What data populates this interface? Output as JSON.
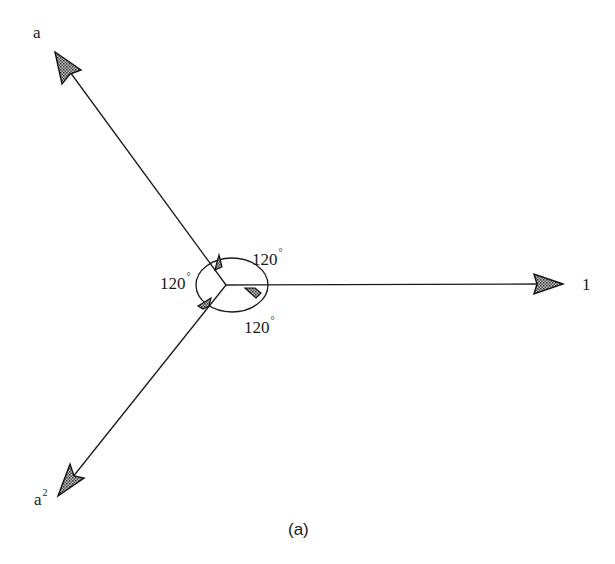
{
  "figure": {
    "caption": "(a)",
    "vectors": [
      {
        "name": "1",
        "label": "1",
        "angle_deg": 0
      },
      {
        "name": "a",
        "label": "a",
        "angle_deg": 120
      },
      {
        "name": "a2",
        "label": "a",
        "label_superscript": "2",
        "angle_deg": 240
      }
    ],
    "angle_labels": [
      {
        "value": "120",
        "unit": "°",
        "position": "upper-right"
      },
      {
        "value": "120",
        "unit": "°",
        "position": "left"
      },
      {
        "value": "120",
        "unit": "°",
        "position": "lower-right"
      }
    ],
    "colors": {
      "stroke": "#1a1a1a",
      "arrow_fill": "#9a9a9a",
      "background": "#ffffff"
    }
  }
}
